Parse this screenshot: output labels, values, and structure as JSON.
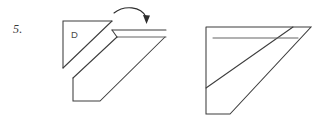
{
  "page": {
    "width": 323,
    "height": 132,
    "background_color": "#ffffff",
    "ink_color": "#3d3d3d"
  },
  "problem": {
    "number_label": "5.",
    "region_label": "D"
  },
  "figure": {
    "type": "geometry-paper-folding-diagram",
    "description_left": "right triangle labeled D attached by a fold line to a pentagon body, with a narrow parallelogram strip at the upper right",
    "description_right": "resulting folded shape: large right-triangle-like outline with interior fold lines",
    "arrow": {
      "name": "fold-arrow",
      "direction": "curved-right-down"
    },
    "left_shape": {
      "triangle_points": "63,21 112,21 63,68",
      "fold_diagonal": "63,68 112,21",
      "body_outline": "73,78 73,101 100,101 165,37 117,37",
      "strip_top": "112,30 165,30",
      "strip_inner": "117,37 165,37",
      "strip_edge_left": "112,30 117,37",
      "strip_edge_right": "165,30 165,37"
    },
    "right_shape": {
      "outline": "206,27 310,27 230,114 206,114",
      "left_vertical": "206,27 206,114",
      "top_edge": "206,27 310,27",
      "bottom_edge": "206,114 230,114",
      "hypotenuse": "230,114 310,27",
      "inner_diagonal": "206,88 292,27",
      "inner_strip_line": "213,38 297,38",
      "inner_strip_left": "206,88 213,38"
    }
  }
}
